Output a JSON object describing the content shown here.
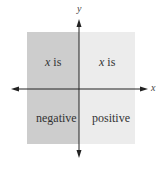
{
  "diagram": {
    "colors": {
      "left_region": "#cdcdcd",
      "right_region": "#ececec",
      "axis": "#222222",
      "text": "#333333"
    },
    "axes": {
      "x_label": "x",
      "y_label": "y"
    },
    "regions": {
      "left": {
        "line1_var": "x",
        "line1_rest": " is",
        "line2": "negative"
      },
      "right": {
        "line1_var": "x",
        "line1_rest": " is",
        "line2": "positive"
      }
    }
  }
}
